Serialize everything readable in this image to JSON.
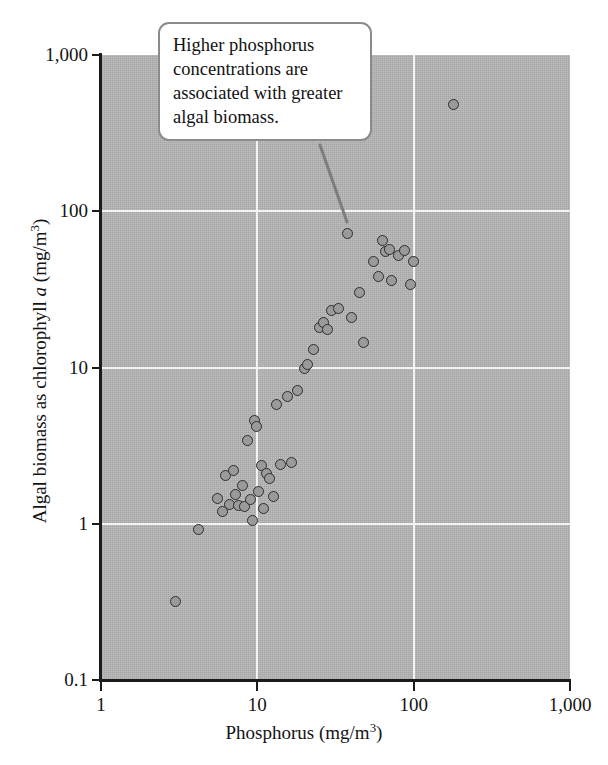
{
  "chart_data": {
    "type": "scatter",
    "title": "",
    "xlabel": "Phosphorus (mg/m3)",
    "ylabel": "Algal biomass as chlorophyll a (mg/m3)",
    "xscale": "log",
    "yscale": "log",
    "xlim": [
      1,
      1000
    ],
    "ylim": [
      0.1,
      1000
    ],
    "grid": true,
    "legend": null,
    "x_ticklabels": [
      "1",
      "10",
      "100",
      "1,000"
    ],
    "x_tickvalues": [
      1,
      10,
      100,
      1000
    ],
    "y_ticklabels": [
      "1,000",
      "100",
      "10",
      "1",
      "0.1"
    ],
    "y_tickvalues": [
      1000,
      100,
      10,
      1,
      0.1
    ],
    "series": [
      {
        "name": "Lakes",
        "marker": "circle",
        "marker_fill": "#9a9a9a",
        "marker_edge": "#2d2d2d",
        "points": [
          [
            3.0,
            0.32
          ],
          [
            4.2,
            0.92
          ],
          [
            5.6,
            1.45
          ],
          [
            6.0,
            1.2
          ],
          [
            6.3,
            2.05
          ],
          [
            6.6,
            1.32
          ],
          [
            7.0,
            2.2
          ],
          [
            7.2,
            1.55
          ],
          [
            7.6,
            1.3
          ],
          [
            8.0,
            1.75
          ],
          [
            8.3,
            1.28
          ],
          [
            8.6,
            3.4
          ],
          [
            9.0,
            1.42
          ],
          [
            9.3,
            1.05
          ],
          [
            9.6,
            4.6
          ],
          [
            9.9,
            4.2
          ],
          [
            10.2,
            1.6
          ],
          [
            10.6,
            2.35
          ],
          [
            11.0,
            1.25
          ],
          [
            11.5,
            2.1
          ],
          [
            12.0,
            1.95
          ],
          [
            12.6,
            1.5
          ],
          [
            13.2,
            5.8
          ],
          [
            14.0,
            2.4
          ],
          [
            15.5,
            6.5
          ],
          [
            16.5,
            2.45
          ],
          [
            18.0,
            7.1
          ],
          [
            20.0,
            9.8
          ],
          [
            21.0,
            10.5
          ],
          [
            23.0,
            13.0
          ],
          [
            25.0,
            18.0
          ],
          [
            26.5,
            19.5
          ],
          [
            28.0,
            17.5
          ],
          [
            30.0,
            23.0
          ],
          [
            33.0,
            24.0
          ],
          [
            38.0,
            72.0
          ],
          [
            40.0,
            21.0
          ],
          [
            45.0,
            30.0
          ],
          [
            48.0,
            14.5
          ],
          [
            55.0,
            48.0
          ],
          [
            60.0,
            38.0
          ],
          [
            63.0,
            65.0
          ],
          [
            66.0,
            55.0
          ],
          [
            70.0,
            57.0
          ],
          [
            72.0,
            36.0
          ],
          [
            80.0,
            52.0
          ],
          [
            88.0,
            56.0
          ],
          [
            95.0,
            34.0
          ],
          [
            100.0,
            48.0
          ],
          [
            180.0,
            480.0
          ]
        ]
      }
    ],
    "annotations": [
      {
        "name": "callout",
        "text": "Higher phosphorus concentrations are associated with greater algal biomass.",
        "lines": [
          "Higher phosphorus",
          "concentrations are",
          "associated with greater",
          "algal biomass."
        ],
        "points_to": [
          38.0,
          72.0
        ]
      }
    ],
    "colors": {
      "plot_background": "#b5b5b5",
      "gridline": "#f3f3f3",
      "axis": "#1b1b1b",
      "marker_fill": "#9a9a9a",
      "marker_edge": "#2d2d2d",
      "callout_border": "#8b8b8b",
      "callout_background": "#ffffff",
      "page_background": "#ffffff"
    }
  },
  "axis": {
    "x_title_main": "Phosphorus (mg/m",
    "x_title_sup": "3",
    "x_title_tail": ")",
    "y_title_pre": "Algal biomass as chlorophyll ",
    "y_title_italic": "a",
    "y_title_mid": " (mg/m",
    "y_title_sup": "3",
    "y_title_tail": ")"
  },
  "callout": {
    "line1": "Higher phosphorus",
    "line2": "concentrations are",
    "line3": "associated with greater",
    "line4": "algal biomass."
  }
}
